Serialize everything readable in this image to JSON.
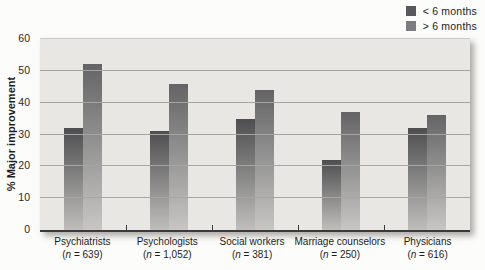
{
  "chart_data": {
    "type": "bar",
    "title": "",
    "ylabel": "% Major improvement",
    "xlabel": "",
    "ylim": [
      0,
      60
    ],
    "yticks": [
      0,
      10,
      20,
      30,
      40,
      50,
      60
    ],
    "grid": "horizontal",
    "legend_position": "top-right",
    "categories": [
      {
        "name": "Psychiatrists",
        "n": "639"
      },
      {
        "name": "Psychologists",
        "n": "1,052"
      },
      {
        "name": "Social workers",
        "n": "381"
      },
      {
        "name": "Marriage counselors",
        "n": "250"
      },
      {
        "name": "Physicians",
        "n": "616"
      }
    ],
    "series": [
      {
        "name": "< 6 months",
        "values": [
          32,
          31,
          35,
          22,
          32
        ],
        "color_top": "#4e4e50",
        "color_bottom": "#bfbebb",
        "legend_color": "#59595b"
      },
      {
        "name": "> 6 months",
        "values": [
          52,
          46,
          44,
          37,
          36
        ],
        "color_top": "#646466",
        "color_bottom": "#c7c6c3",
        "legend_color": "#7d7d7f"
      }
    ],
    "n_label": {
      "open": "(",
      "symbol": "n",
      "equals": " = ",
      "close": ")"
    }
  },
  "colors": {
    "page_bg": "#fcfcfa",
    "plot_bg": "#e8e7e3",
    "gridline": "#a6a5a2",
    "axis": "#3b3a38",
    "text": "#1e1d1b"
  }
}
